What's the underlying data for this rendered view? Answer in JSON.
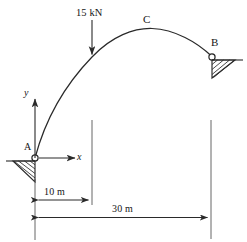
{
  "diagram": {
    "type": "structural-arch-free-body-diagram",
    "title_visible": false,
    "colors": {
      "line": "#2a2a2a",
      "text": "#161616",
      "background": "#ffffff"
    },
    "labels": {
      "load": "15 kN",
      "crown": "C",
      "support_right": "B",
      "support_left": "A",
      "axis_y": "y",
      "axis_x": "x",
      "dim_short": "10 m",
      "dim_long": "30 m"
    },
    "geometry": {
      "span_m": 30,
      "load_position_m": 10,
      "supports": [
        {
          "name": "A",
          "kind": "pin",
          "x_m": 0
        },
        {
          "name": "B",
          "kind": "pin",
          "x_m": 30
        }
      ],
      "loads": [
        {
          "label": "15 kN",
          "magnitude": 15,
          "unit": "kN",
          "direction": "down",
          "x_m": 10
        }
      ],
      "crown_label": "C"
    }
  }
}
